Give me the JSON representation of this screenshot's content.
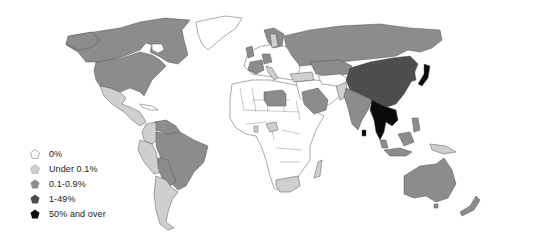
{
  "map": {
    "type": "choropleth",
    "region": "World",
    "categories": [
      {
        "key": "c0",
        "label": "0%",
        "color": "#ffffff"
      },
      {
        "key": "c1",
        "label": "Under 0.1%",
        "color": "#cfcfcf"
      },
      {
        "key": "c2",
        "label": "0.1-0.9%",
        "color": "#8c8c8c"
      },
      {
        "key": "c3",
        "label": "1-49%",
        "color": "#4d4d4d"
      },
      {
        "key": "c4",
        "label": "50% and over",
        "color": "#0a0a0a"
      }
    ],
    "regions": {
      "50% and over": [
        "Japan",
        "Thailand",
        "Myanmar",
        "Cambodia",
        "Laos",
        "Vietnam",
        "Sri Lanka",
        "Bhutan"
      ],
      "1-49%": [
        "China",
        "Mongolia",
        "North Korea",
        "South Korea",
        "Taiwan",
        "Singapore"
      ],
      "0.1-0.9%": [
        "United States",
        "Canada",
        "Brazil",
        "Russia",
        "Kazakhstan",
        "India",
        "Australia",
        "New Zealand",
        "Malaysia",
        "Indonesia",
        "Philippines",
        "France",
        "United Kingdom",
        "Germany",
        "Norway",
        "Saudi Arabia",
        "Libya",
        "Bolivia",
        "Paraguay",
        "Venezuela",
        "Guyana",
        "Suriname"
      ],
      "Under 0.1%": [
        "Mexico",
        "Central America",
        "Colombia",
        "Ecuador",
        "Peru",
        "Chile",
        "Argentina",
        "Uruguay",
        "South Africa",
        "Madagascar",
        "Nigeria",
        "Ghana",
        "Turkey",
        "Pakistan",
        "Sweden",
        "Italy",
        "Papua New Guinea"
      ],
      "0%": [
        "Greenland",
        "most of Africa",
        "most of Middle East",
        "Eastern Europe",
        "Central Asia"
      ]
    }
  },
  "legend": {
    "items": [
      {
        "label": "0%"
      },
      {
        "label": "Under 0.1%"
      },
      {
        "label": "0.1-0.9%"
      },
      {
        "label": "1-49%"
      },
      {
        "label": "50% and over"
      }
    ]
  }
}
